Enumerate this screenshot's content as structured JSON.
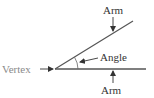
{
  "diagram": {
    "labels": {
      "vertex": "Vertex",
      "angle": "Angle",
      "arm_top": "Arm",
      "arm_bottom": "Arm"
    },
    "colors": {
      "line": "#4a4a4a",
      "text": "#333333",
      "vertex_text": "#8a8a8a"
    }
  }
}
